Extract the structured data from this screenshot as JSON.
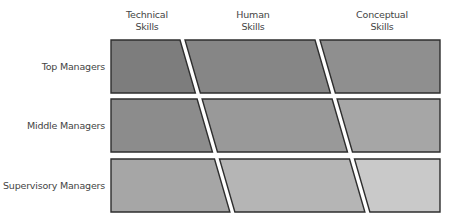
{
  "diagram": {
    "columns": [
      {
        "line1": "Technical",
        "line2": "Skills",
        "center_x": 147
      },
      {
        "line1": "Human",
        "line2": "Skills",
        "center_x": 253
      },
      {
        "line1": "Conceptual",
        "line2": "Skills",
        "center_x": 382
      }
    ],
    "rows": [
      {
        "label": "Top Managers",
        "y_top": 40,
        "y_bottom": 93,
        "colors": [
          "#7d7d7d",
          "#868686",
          "#8f8f8f"
        ]
      },
      {
        "label": "Middle Managers",
        "y_top": 99,
        "y_bottom": 152,
        "colors": [
          "#8c8c8c",
          "#999999",
          "#a6a6a6"
        ]
      },
      {
        "label": "Supervisory Managers",
        "y_top": 159,
        "y_bottom": 212,
        "colors": [
          "#a6a6a6",
          "#b5b5b5",
          "#c9c9c9"
        ]
      }
    ],
    "geometry": {
      "left_x": 111,
      "right_x": 440,
      "divider1_x_at_top": 180,
      "divider2_x_at_top": 315,
      "divider_top_y": 40,
      "divider_slope": 0.29,
      "gap": 5
    },
    "border_color": "#2e2e2e"
  }
}
